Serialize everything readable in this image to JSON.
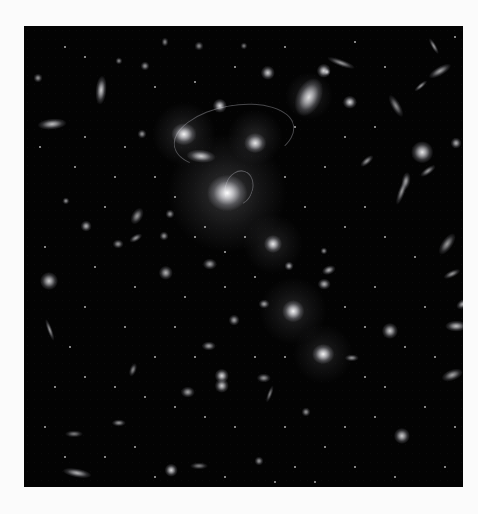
{
  "image": {
    "subject": "galaxy cluster deep field",
    "background_color": "#030303",
    "page_color": "#fbfbfb",
    "frame": {
      "left": 24,
      "top": 26,
      "width": 439,
      "height": 461
    }
  },
  "halos": [
    {
      "x": 203,
      "y": 167,
      "r": 60,
      "a": 0.22
    },
    {
      "x": 160,
      "y": 108,
      "r": 32,
      "a": 0.18
    },
    {
      "x": 231,
      "y": 111,
      "r": 28,
      "a": 0.16
    },
    {
      "x": 249,
      "y": 218,
      "r": 30,
      "a": 0.14
    },
    {
      "x": 269,
      "y": 285,
      "r": 34,
      "a": 0.16
    },
    {
      "x": 299,
      "y": 328,
      "r": 30,
      "a": 0.14
    },
    {
      "x": 285,
      "y": 70,
      "r": 24,
      "a": 0.16
    }
  ],
  "arcs": [
    {
      "x": 210,
      "y": 110,
      "w": 120,
      "h": 60,
      "rot": -10
    },
    {
      "x": 215,
      "y": 162,
      "w": 26,
      "h": 34,
      "rot": 20
    }
  ],
  "galaxies": [
    {
      "x": 203,
      "y": 167,
      "w": 22,
      "h": 20,
      "b": 1.0,
      "rot": 0
    },
    {
      "x": 160,
      "y": 108,
      "w": 14,
      "h": 12,
      "b": 0.95,
      "rot": 0
    },
    {
      "x": 231,
      "y": 117,
      "w": 12,
      "h": 11,
      "b": 0.9,
      "rot": 0
    },
    {
      "x": 196,
      "y": 80,
      "w": 8,
      "h": 8,
      "b": 0.85,
      "rot": 0
    },
    {
      "x": 177,
      "y": 130,
      "w": 16,
      "h": 7,
      "b": 0.8,
      "rot": 5
    },
    {
      "x": 285,
      "y": 71,
      "w": 14,
      "h": 22,
      "b": 0.85,
      "rot": 25
    },
    {
      "x": 326,
      "y": 76,
      "w": 8,
      "h": 7,
      "b": 0.85,
      "rot": 0
    },
    {
      "x": 300,
      "y": 45,
      "w": 8,
      "h": 8,
      "b": 0.85,
      "rot": 0
    },
    {
      "x": 244,
      "y": 47,
      "w": 8,
      "h": 8,
      "b": 0.8,
      "rot": 0
    },
    {
      "x": 249,
      "y": 218,
      "w": 10,
      "h": 10,
      "b": 0.9,
      "rot": 0
    },
    {
      "x": 269,
      "y": 285,
      "w": 12,
      "h": 12,
      "b": 0.95,
      "rot": 0
    },
    {
      "x": 299,
      "y": 328,
      "w": 12,
      "h": 11,
      "b": 0.95,
      "rot": 0
    },
    {
      "x": 198,
      "y": 350,
      "w": 8,
      "h": 8,
      "b": 0.85,
      "rot": 0
    },
    {
      "x": 198,
      "y": 360,
      "w": 8,
      "h": 8,
      "b": 0.8,
      "rot": 0
    },
    {
      "x": 77,
      "y": 64,
      "w": 6,
      "h": 16,
      "b": 0.8,
      "rot": 5
    },
    {
      "x": 28,
      "y": 98,
      "w": 16,
      "h": 6,
      "b": 0.75,
      "rot": -5
    },
    {
      "x": 398,
      "y": 126,
      "w": 12,
      "h": 12,
      "b": 0.9,
      "rot": 0
    },
    {
      "x": 25,
      "y": 255,
      "w": 10,
      "h": 10,
      "b": 0.8,
      "rot": 0
    },
    {
      "x": 26,
      "y": 304,
      "w": 3,
      "h": 13,
      "b": 0.6,
      "rot": -20
    },
    {
      "x": 366,
      "y": 305,
      "w": 9,
      "h": 9,
      "b": 0.8,
      "rot": 0
    },
    {
      "x": 378,
      "y": 410,
      "w": 9,
      "h": 9,
      "b": 0.8,
      "rot": 0
    },
    {
      "x": 303,
      "y": 46,
      "w": 4,
      "h": 4,
      "b": 0.7,
      "rot": 0
    },
    {
      "x": 317,
      "y": 37,
      "w": 16,
      "h": 4,
      "b": 0.6,
      "rot": 20
    },
    {
      "x": 410,
      "y": 20,
      "w": 3,
      "h": 10,
      "b": 0.6,
      "rot": -30
    },
    {
      "x": 416,
      "y": 45,
      "w": 14,
      "h": 5,
      "b": 0.65,
      "rot": -30
    },
    {
      "x": 372,
      "y": 80,
      "w": 5,
      "h": 14,
      "b": 0.55,
      "rot": -30
    },
    {
      "x": 397,
      "y": 60,
      "w": 9,
      "h": 3,
      "b": 0.6,
      "rot": -40
    },
    {
      "x": 378,
      "y": 165,
      "w": 4,
      "h": 16,
      "b": 0.6,
      "rot": 20
    },
    {
      "x": 382,
      "y": 155,
      "w": 5,
      "h": 10,
      "b": 0.6,
      "rot": 10
    },
    {
      "x": 404,
      "y": 145,
      "w": 10,
      "h": 4,
      "b": 0.6,
      "rot": -35
    },
    {
      "x": 343,
      "y": 135,
      "w": 9,
      "h": 4,
      "b": 0.6,
      "rot": -40
    },
    {
      "x": 432,
      "y": 117,
      "w": 6,
      "h": 6,
      "b": 0.7,
      "rot": 0
    },
    {
      "x": 423,
      "y": 218,
      "w": 6,
      "h": 14,
      "b": 0.6,
      "rot": 35
    },
    {
      "x": 428,
      "y": 248,
      "w": 10,
      "h": 4,
      "b": 0.6,
      "rot": -25
    },
    {
      "x": 439,
      "y": 278,
      "w": 8,
      "h": 5,
      "b": 0.7,
      "rot": -30
    },
    {
      "x": 432,
      "y": 300,
      "w": 12,
      "h": 6,
      "b": 0.75,
      "rot": 0
    },
    {
      "x": 428,
      "y": 349,
      "w": 12,
      "h": 6,
      "b": 0.65,
      "rot": -20
    },
    {
      "x": 328,
      "y": 332,
      "w": 8,
      "h": 4,
      "b": 0.6,
      "rot": 0
    },
    {
      "x": 305,
      "y": 244,
      "w": 8,
      "h": 5,
      "b": 0.7,
      "rot": -20
    },
    {
      "x": 300,
      "y": 258,
      "w": 7,
      "h": 6,
      "b": 0.7,
      "rot": 0
    },
    {
      "x": 265,
      "y": 240,
      "w": 5,
      "h": 5,
      "b": 0.7,
      "rot": 0
    },
    {
      "x": 300,
      "y": 225,
      "w": 4,
      "h": 4,
      "b": 0.6,
      "rot": 0
    },
    {
      "x": 62,
      "y": 200,
      "w": 6,
      "h": 6,
      "b": 0.7,
      "rot": 0
    },
    {
      "x": 42,
      "y": 175,
      "w": 4,
      "h": 4,
      "b": 0.6,
      "rot": 0
    },
    {
      "x": 94,
      "y": 218,
      "w": 6,
      "h": 5,
      "b": 0.6,
      "rot": 0
    },
    {
      "x": 113,
      "y": 190,
      "w": 6,
      "h": 10,
      "b": 0.6,
      "rot": 30
    },
    {
      "x": 112,
      "y": 212,
      "w": 8,
      "h": 4,
      "b": 0.6,
      "rot": -30
    },
    {
      "x": 146,
      "y": 188,
      "w": 5,
      "h": 5,
      "b": 0.6,
      "rot": 0
    },
    {
      "x": 140,
      "y": 210,
      "w": 5,
      "h": 5,
      "b": 0.6,
      "rot": 0
    },
    {
      "x": 142,
      "y": 247,
      "w": 8,
      "h": 8,
      "b": 0.7,
      "rot": 0
    },
    {
      "x": 186,
      "y": 238,
      "w": 8,
      "h": 6,
      "b": 0.65,
      "rot": 0
    },
    {
      "x": 185,
      "y": 320,
      "w": 8,
      "h": 5,
      "b": 0.65,
      "rot": 0
    },
    {
      "x": 164,
      "y": 366,
      "w": 8,
      "h": 6,
      "b": 0.65,
      "rot": 0
    },
    {
      "x": 109,
      "y": 344,
      "w": 4,
      "h": 8,
      "b": 0.55,
      "rot": 20
    },
    {
      "x": 95,
      "y": 397,
      "w": 8,
      "h": 4,
      "b": 0.6,
      "rot": 0
    },
    {
      "x": 50,
      "y": 408,
      "w": 10,
      "h": 4,
      "b": 0.5,
      "rot": 0
    },
    {
      "x": 53,
      "y": 447,
      "w": 16,
      "h": 5,
      "b": 0.7,
      "rot": 10
    },
    {
      "x": 147,
      "y": 444,
      "w": 7,
      "h": 7,
      "b": 0.85,
      "rot": 0
    },
    {
      "x": 235,
      "y": 435,
      "w": 5,
      "h": 5,
      "b": 0.6,
      "rot": 0
    },
    {
      "x": 240,
      "y": 278,
      "w": 6,
      "h": 5,
      "b": 0.65,
      "rot": 0
    },
    {
      "x": 210,
      "y": 294,
      "w": 6,
      "h": 6,
      "b": 0.65,
      "rot": 0
    },
    {
      "x": 175,
      "y": 440,
      "w": 10,
      "h": 4,
      "b": 0.5,
      "rot": 0
    },
    {
      "x": 282,
      "y": 386,
      "w": 5,
      "h": 5,
      "b": 0.6,
      "rot": 0
    },
    {
      "x": 240,
      "y": 352,
      "w": 8,
      "h": 5,
      "b": 0.6,
      "rot": 0
    },
    {
      "x": 246,
      "y": 368,
      "w": 3,
      "h": 10,
      "b": 0.5,
      "rot": 20
    },
    {
      "x": 118,
      "y": 108,
      "w": 5,
      "h": 5,
      "b": 0.6,
      "rot": 0
    },
    {
      "x": 121,
      "y": 40,
      "w": 5,
      "h": 5,
      "b": 0.6,
      "rot": 0
    },
    {
      "x": 95,
      "y": 35,
      "w": 4,
      "h": 4,
      "b": 0.55,
      "rot": 0
    },
    {
      "x": 14,
      "y": 52,
      "w": 5,
      "h": 5,
      "b": 0.6,
      "rot": 0
    },
    {
      "x": 141,
      "y": 16,
      "w": 4,
      "h": 5,
      "b": 0.55,
      "rot": 0
    },
    {
      "x": 175,
      "y": 20,
      "w": 5,
      "h": 5,
      "b": 0.55,
      "rot": 0
    },
    {
      "x": 220,
      "y": 20,
      "w": 4,
      "h": 4,
      "b": 0.5,
      "rot": 0
    }
  ],
  "dots": [
    [
      40,
      20
    ],
    [
      60,
      30
    ],
    [
      130,
      60
    ],
    [
      170,
      55
    ],
    [
      210,
      40
    ],
    [
      260,
      20
    ],
    [
      330,
      15
    ],
    [
      360,
      40
    ],
    [
      430,
      10
    ],
    [
      15,
      120
    ],
    [
      50,
      140
    ],
    [
      90,
      150
    ],
    [
      130,
      150
    ],
    [
      80,
      180
    ],
    [
      20,
      220
    ],
    [
      70,
      240
    ],
    [
      110,
      260
    ],
    [
      160,
      270
    ],
    [
      200,
      260
    ],
    [
      230,
      250
    ],
    [
      320,
      200
    ],
    [
      340,
      180
    ],
    [
      360,
      210
    ],
    [
      390,
      230
    ],
    [
      350,
      260
    ],
    [
      320,
      280
    ],
    [
      340,
      300
    ],
    [
      380,
      320
    ],
    [
      410,
      330
    ],
    [
      400,
      380
    ],
    [
      350,
      390
    ],
    [
      320,
      400
    ],
    [
      300,
      420
    ],
    [
      270,
      440
    ],
    [
      250,
      455
    ],
    [
      210,
      400
    ],
    [
      180,
      390
    ],
    [
      150,
      380
    ],
    [
      120,
      370
    ],
    [
      90,
      360
    ],
    [
      60,
      350
    ],
    [
      30,
      360
    ],
    [
      20,
      400
    ],
    [
      40,
      430
    ],
    [
      80,
      430
    ],
    [
      110,
      420
    ],
    [
      130,
      450
    ],
    [
      200,
      450
    ],
    [
      290,
      455
    ],
    [
      330,
      440
    ],
    [
      370,
      450
    ],
    [
      420,
      440
    ],
    [
      430,
      400
    ],
    [
      400,
      280
    ],
    [
      360,
      360
    ],
    [
      260,
      400
    ],
    [
      230,
      330
    ],
    [
      150,
      300
    ],
    [
      100,
      300
    ],
    [
      60,
      280
    ],
    [
      45,
      320
    ],
    [
      130,
      330
    ],
    [
      170,
      330
    ],
    [
      260,
      330
    ],
    [
      340,
      350
    ],
    [
      280,
      180
    ],
    [
      260,
      150
    ],
    [
      300,
      140
    ],
    [
      320,
      110
    ],
    [
      350,
      100
    ],
    [
      270,
      100
    ],
    [
      150,
      170
    ],
    [
      100,
      120
    ],
    [
      60,
      110
    ],
    [
      170,
      210
    ],
    [
      220,
      210
    ],
    [
      200,
      225
    ],
    [
      180,
      200
    ]
  ]
}
